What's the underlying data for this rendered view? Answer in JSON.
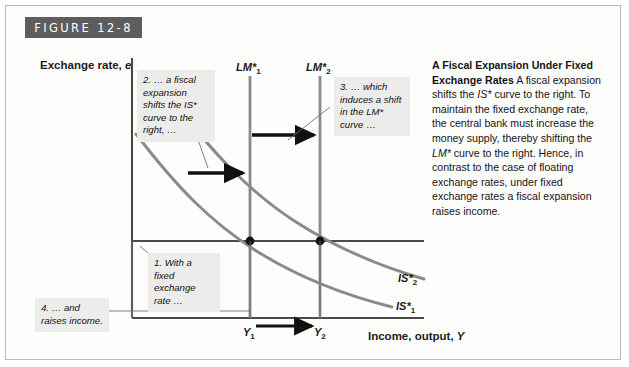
{
  "figure": {
    "banner_label": "FIGURE 12-8",
    "banner_color": "#5d5d5d"
  },
  "axes": {
    "y_title_text": "Exchange rate, ",
    "y_title_italic": "e",
    "x_title_text": "Income, output, ",
    "x_title_italic": "Y",
    "x_tick_1": "Y",
    "x_tick_1_sub": "1",
    "x_tick_2": "Y",
    "x_tick_2_sub": "2"
  },
  "curves": {
    "lm1_label": "LM",
    "lm1_star": "*",
    "lm1_sub": "1",
    "lm2_label": "LM",
    "lm2_star": "*",
    "lm2_sub": "2",
    "is1_label": "IS",
    "is1_star": "*",
    "is1_sub": "1",
    "is2_label": "IS",
    "is2_star": "*",
    "is2_sub": "2",
    "curve_color": "#8a8a8a",
    "axis_color": "#4a4a4a"
  },
  "callouts": {
    "one": "1. With a fixed exchange rate …",
    "two": "2. … a fiscal expansion shifts the IS* curve to the right, …",
    "three": "3. … which induces a shift in the LM* curve …",
    "four": "4. … and raises income."
  },
  "caption": {
    "heading": "A Fiscal Expansion Under Fixed Exchange Rates",
    "body_1": " A fiscal expansion shifts the ",
    "em_1": "IS*",
    "body_2": " curve to the right. To maintain the fixed exchange rate, the central bank must increase the money supply, thereby shifting the ",
    "em_2": "LM*",
    "body_3": " curve to the right. Hence, in contrast to the case of floating exchange rates, under fixed exchange rates a fiscal expansion raises income."
  }
}
